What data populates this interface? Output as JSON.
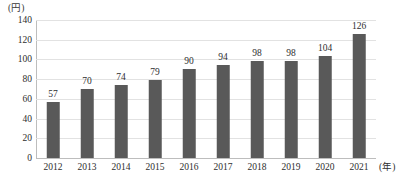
{
  "chart_data": {
    "type": "bar",
    "title": "",
    "xlabel": "(年)",
    "ylabel": "(円)",
    "categories": [
      "2012",
      "2013",
      "2014",
      "2015",
      "2016",
      "2017",
      "2018",
      "2019",
      "2020",
      "2021"
    ],
    "values": [
      57,
      70,
      74,
      79,
      90,
      94,
      98,
      98,
      104,
      126
    ],
    "value_labels": [
      "57",
      "70",
      "74",
      "79",
      "90",
      "94",
      "98",
      "98",
      "104",
      "126"
    ],
    "ylim": [
      0,
      140
    ],
    "ytick_values": [
      140,
      120,
      100,
      80,
      60,
      40,
      20,
      0
    ],
    "ytick_labels": [
      "140",
      "120",
      "100",
      "80",
      "60",
      "40",
      "20",
      "0"
    ],
    "grid": true,
    "legend": "none",
    "bar_color": "#595959",
    "gridline_color": "#e2e2e2",
    "axis_color": "#bdbdbd",
    "background_color": "#ffffff",
    "text_color": "#2e2e2e"
  }
}
